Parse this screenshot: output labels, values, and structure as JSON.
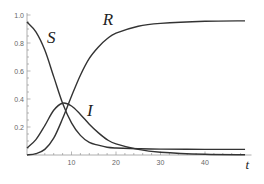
{
  "chart_data": {
    "type": "line",
    "title": "",
    "xlabel": "t",
    "ylabel": "",
    "xlim": [
      0,
      50
    ],
    "ylim": [
      0,
      1.0
    ],
    "x_ticks": [
      10,
      20,
      30,
      40
    ],
    "y_ticks": [
      0.2,
      0.4,
      0.6,
      0.8,
      1.0
    ],
    "x_tick_labels": [
      "10",
      "20",
      "30",
      "40"
    ],
    "y_tick_labels": [
      "0.2",
      "0.4",
      "0.6",
      "0.8",
      "1.0"
    ],
    "grid": false,
    "legend": "none (inline curve labels)",
    "series": [
      {
        "name": "S",
        "x": [
          0,
          2,
          4,
          6,
          8,
          10,
          12,
          14,
          16,
          18,
          20,
          25,
          30,
          40,
          49
        ],
        "values": [
          0.95,
          0.88,
          0.75,
          0.56,
          0.37,
          0.23,
          0.14,
          0.09,
          0.07,
          0.055,
          0.05,
          0.045,
          0.042,
          0.04,
          0.04
        ]
      },
      {
        "name": "I",
        "x": [
          0,
          2,
          4,
          6,
          8,
          10,
          12,
          14,
          16,
          18,
          20,
          25,
          30,
          40,
          49
        ],
        "values": [
          0.05,
          0.11,
          0.21,
          0.32,
          0.37,
          0.35,
          0.29,
          0.22,
          0.16,
          0.11,
          0.08,
          0.04,
          0.02,
          0.005,
          0.002
        ]
      },
      {
        "name": "R",
        "x": [
          0,
          2,
          4,
          6,
          8,
          10,
          12,
          14,
          16,
          18,
          20,
          25,
          30,
          40,
          49
        ],
        "values": [
          0.0,
          0.01,
          0.04,
          0.12,
          0.26,
          0.42,
          0.57,
          0.69,
          0.77,
          0.83,
          0.87,
          0.92,
          0.94,
          0.955,
          0.958
        ]
      }
    ],
    "annotations": [
      {
        "text": "S",
        "x": 4.5,
        "y": 0.8
      },
      {
        "text": "R",
        "x": 17,
        "y": 0.93
      },
      {
        "text": "I",
        "x": 13.5,
        "y": 0.28
      }
    ]
  }
}
